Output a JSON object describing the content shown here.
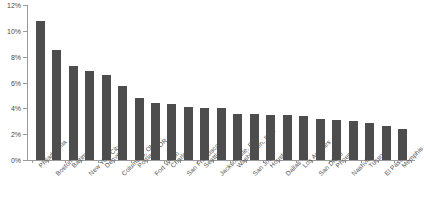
{
  "chart_data": {
    "type": "bar",
    "title": "",
    "xlabel": "",
    "ylabel": "",
    "ylim": [
      0,
      12
    ],
    "ytick_labels": [
      "12%",
      "10%",
      "8%",
      "6%",
      "4%",
      "2%",
      "0%"
    ],
    "ytick_values": [
      12,
      10,
      8,
      6,
      4,
      2,
      0
    ],
    "grid": false,
    "legend": false,
    "bar_color": "#4d4d4d",
    "axis_color": "#9a9a9a",
    "categories": [
      "Philadelphia",
      "Boston",
      "Baltimore",
      "New York City",
      "Denver",
      "Columbus, OH",
      "Portland, OR",
      "Fort Worth",
      "Charlotte",
      "San Francisco",
      "Seattle",
      "Jacksonville, FL",
      "Washington, D.C.",
      "San Jose",
      "Houston",
      "Dallas",
      "Los Angeles",
      "San Diego",
      "Phoenix",
      "Nashville",
      "Tucson",
      "El Paso",
      "Memphis"
    ],
    "values": [
      10.8,
      8.5,
      7.3,
      6.9,
      6.6,
      5.7,
      4.8,
      4.4,
      4.3,
      4.1,
      4.0,
      4.0,
      3.6,
      3.6,
      3.5,
      3.5,
      3.4,
      3.2,
      3.1,
      3.0,
      2.9,
      2.6,
      2.4
    ]
  }
}
